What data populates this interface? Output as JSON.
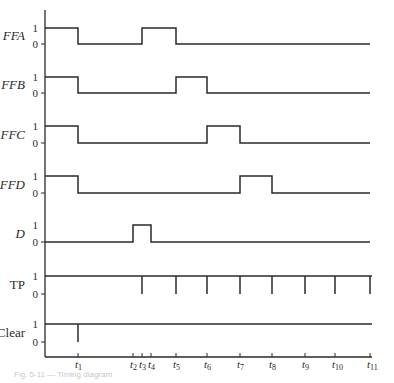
{
  "diagram": {
    "type": "timing-diagram",
    "ink_color": "#2a2a2a",
    "level_labels": {
      "high": "1",
      "low": "0"
    },
    "signals": [
      {
        "name": "FFA",
        "italic": true,
        "y_high": 28,
        "y_low": 44,
        "transitions": [
          [
            45,
            1
          ],
          [
            78,
            0
          ],
          [
            142,
            1
          ],
          [
            176,
            0
          ],
          [
            370,
            0
          ]
        ]
      },
      {
        "name": "FFB",
        "italic": true,
        "y_high": 77,
        "y_low": 93,
        "transitions": [
          [
            45,
            1
          ],
          [
            78,
            0
          ],
          [
            176,
            1
          ],
          [
            207,
            0
          ],
          [
            370,
            0
          ]
        ]
      },
      {
        "name": "FFC",
        "italic": true,
        "y_high": 126,
        "y_low": 143,
        "transitions": [
          [
            45,
            1
          ],
          [
            78,
            0
          ],
          [
            207,
            1
          ],
          [
            240,
            0
          ],
          [
            370,
            0
          ]
        ]
      },
      {
        "name": "FFD",
        "italic": true,
        "y_high": 176,
        "y_low": 193,
        "transitions": [
          [
            45,
            1
          ],
          [
            78,
            0
          ],
          [
            240,
            1
          ],
          [
            272,
            0
          ],
          [
            370,
            0
          ]
        ]
      },
      {
        "name": "D",
        "italic": true,
        "y_high": 225,
        "y_low": 242,
        "transitions": [
          [
            45,
            0
          ],
          [
            133,
            1
          ],
          [
            151,
            0
          ],
          [
            370,
            0
          ]
        ]
      },
      {
        "name": "TP",
        "italic": false,
        "y_high": 276,
        "y_low": 294,
        "pulses_down_at": [
          142,
          176,
          207,
          240,
          272,
          305,
          335,
          370
        ]
      },
      {
        "name": "Clear",
        "italic": false,
        "y_high": 324,
        "y_low": 342,
        "pulses_down_at": [
          78
        ]
      }
    ],
    "time_axis": {
      "y": 357,
      "markers": [
        {
          "label": "t",
          "sub": "1",
          "x": 78
        },
        {
          "label": "t",
          "sub": "2",
          "x": 133
        },
        {
          "label": "t",
          "sub": "3",
          "x": 142
        },
        {
          "label": "t",
          "sub": "4",
          "x": 151
        },
        {
          "label": "t",
          "sub": "5",
          "x": 176
        },
        {
          "label": "t",
          "sub": "6",
          "x": 207
        },
        {
          "label": "t",
          "sub": "7",
          "x": 240
        },
        {
          "label": "t",
          "sub": "8",
          "x": 272
        },
        {
          "label": "t",
          "sub": "9",
          "x": 305
        },
        {
          "label": "t",
          "sub": "10",
          "x": 335
        },
        {
          "label": "t",
          "sub": "11",
          "x": 370
        }
      ]
    }
  },
  "caption": "Fig. 5-11 — Timing diagram"
}
